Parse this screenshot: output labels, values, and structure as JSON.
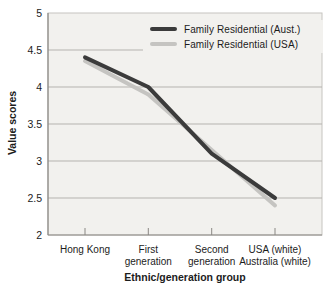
{
  "colors": {
    "plot_bg": "#f2f1ee",
    "plot_border": "#c6c4c0",
    "gridline": "#b5b3af",
    "axis": "#8a8884",
    "text": "#1c1c1c",
    "series_aust": "#3b3b3b",
    "series_usa": "#c5c4c1"
  },
  "chart_data": {
    "type": "line",
    "title": "",
    "xlabel": "Ethnic/generation group",
    "ylabel": "Value scores",
    "categories": [
      "Hong Kong",
      "First generation",
      "Second generation",
      "USA (white) Australia (white)"
    ],
    "category_label_lines": [
      [
        "Hong Kong"
      ],
      [
        "First",
        "generation"
      ],
      [
        "Second",
        "generation"
      ],
      [
        "USA (white)",
        "Australia (white)"
      ]
    ],
    "series": [
      {
        "name": "Family Residential (Aust.)",
        "color": "#3b3b3b",
        "values": [
          4.4,
          4.0,
          3.1,
          2.5
        ]
      },
      {
        "name": "Family Residential (USA)",
        "color": "#c5c4c1",
        "values": [
          4.35,
          3.9,
          3.15,
          2.4
        ]
      }
    ],
    "ylim": [
      2,
      5
    ],
    "yticks": [
      5,
      4.5,
      4,
      3.5,
      3,
      2.5,
      2
    ],
    "ytick_labels": [
      "5",
      "4.5",
      "4",
      "3.5",
      "3",
      "2.5",
      "2"
    ],
    "grid": true,
    "legend_position": "top-right"
  }
}
